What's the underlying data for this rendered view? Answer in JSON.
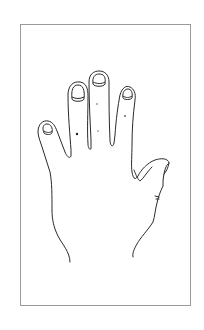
{
  "illustration": {
    "subject": "hand-outline",
    "description": "Line drawing of a left hand, palm/back view, fingers spread, inside a rectangular frame",
    "colors": {
      "background": "#ffffff",
      "frame": "#9a9a9a",
      "line": "#2a2a2a",
      "marks": "#555555"
    },
    "frame": {
      "x": 20,
      "y": 24,
      "width": 171,
      "height": 282
    },
    "fingers": [
      {
        "name": "little",
        "nail": true
      },
      {
        "name": "ring",
        "nail": true
      },
      {
        "name": "middle",
        "nail": true
      },
      {
        "name": "index",
        "nail": true
      },
      {
        "name": "thumb",
        "nail": false
      }
    ],
    "marks": [
      {
        "x": 77,
        "y": 134,
        "style": "dark"
      },
      {
        "x": 97,
        "y": 104,
        "style": "light"
      },
      {
        "x": 98,
        "y": 131,
        "style": "light"
      },
      {
        "x": 125,
        "y": 116,
        "style": "light"
      }
    ]
  }
}
